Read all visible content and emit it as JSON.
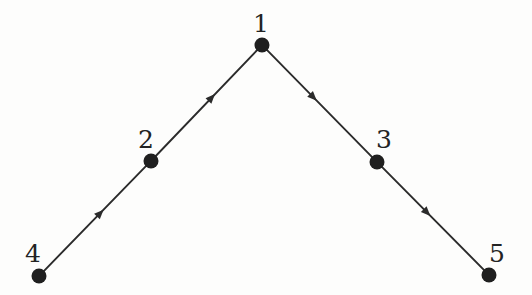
{
  "diagram": {
    "type": "directed-graph",
    "title": "",
    "background_color": "#fdfdfc",
    "node_color": "#1f1f1f",
    "edge_color": "#2b2b2b",
    "label_color": "#232323",
    "node_radius": 7.5,
    "edge_stroke_width": 1.9,
    "canvas": {
      "width": 532,
      "height": 295
    },
    "nodes": [
      {
        "id": "1",
        "label": "1",
        "x": 262,
        "y": 45,
        "label_x": 261,
        "label_y": 23
      },
      {
        "id": "2",
        "label": "2",
        "x": 151,
        "y": 161,
        "label_x": 146,
        "label_y": 139
      },
      {
        "id": "3",
        "label": "3",
        "x": 377,
        "y": 162,
        "label_x": 384,
        "label_y": 139
      },
      {
        "id": "4",
        "label": "4",
        "x": 39,
        "y": 276,
        "label_x": 33,
        "label_y": 253
      },
      {
        "id": "5",
        "label": "5",
        "x": 489,
        "y": 275,
        "label_x": 497,
        "label_y": 253
      }
    ],
    "edges": [
      {
        "id": "e-4-2",
        "from": "4",
        "to": "2",
        "directed": true,
        "arrow_position": 0.55
      },
      {
        "id": "e-2-1",
        "from": "2",
        "to": "1",
        "directed": true,
        "arrow_position": 0.55
      },
      {
        "id": "e-1-3",
        "from": "1",
        "to": "3",
        "directed": true,
        "arrow_position": 0.45
      },
      {
        "id": "e-3-5",
        "from": "3",
        "to": "5",
        "directed": true,
        "arrow_position": 0.45
      }
    ]
  }
}
